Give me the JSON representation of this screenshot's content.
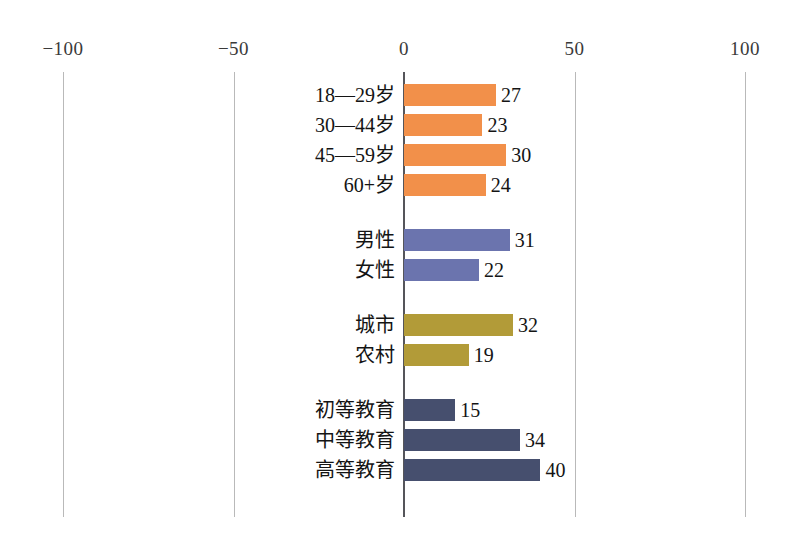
{
  "chart_data": {
    "type": "bar",
    "orientation": "horizontal",
    "title": "",
    "xlabel": "",
    "ylabel": "",
    "xlim": [
      -100,
      100
    ],
    "xticks": [
      -100,
      -50,
      0,
      50,
      100
    ],
    "xtick_labels": [
      "−100",
      "−50",
      "0",
      "50",
      "100"
    ],
    "grid": true,
    "legend": "none",
    "groups": [
      {
        "name": "age",
        "color": "#F2904A",
        "categories": [
          "18—29岁",
          "30—44岁",
          "45—59岁",
          "60+岁"
        ],
        "values": [
          27,
          23,
          30,
          24
        ]
      },
      {
        "name": "gender",
        "color": "#6B74AE",
        "categories": [
          "男性",
          "女性"
        ],
        "values": [
          31,
          22
        ]
      },
      {
        "name": "settlement",
        "color": "#B29B38",
        "categories": [
          "城市",
          "农村"
        ],
        "values": [
          32,
          19
        ]
      },
      {
        "name": "education",
        "color": "#464F6E",
        "categories": [
          "初等教育",
          "中等教育",
          "高等教育"
        ],
        "values": [
          15,
          34,
          40
        ]
      }
    ],
    "categories": [
      "18—29岁",
      "30—44岁",
      "45—59岁",
      "60+岁",
      "男性",
      "女性",
      "城市",
      "农村",
      "初等教育",
      "中等教育",
      "高等教育"
    ],
    "values": [
      27,
      23,
      30,
      24,
      31,
      22,
      32,
      19,
      15,
      34,
      40
    ]
  },
  "axis": {
    "ticks": [
      {
        "label": "−100",
        "value": -100
      },
      {
        "label": "−50",
        "value": -50
      },
      {
        "label": "0",
        "value": 0
      },
      {
        "label": "50",
        "value": 50
      },
      {
        "label": "100",
        "value": 100
      }
    ]
  },
  "rows": [
    {
      "label": "18—29岁",
      "value": 27,
      "value_text": "27",
      "color": "#F2904A",
      "group": "age"
    },
    {
      "label": "30—44岁",
      "value": 23,
      "value_text": "23",
      "color": "#F2904A",
      "group": "age"
    },
    {
      "label": "45—59岁",
      "value": 30,
      "value_text": "30",
      "color": "#F2904A",
      "group": "age"
    },
    {
      "label": "60+岁",
      "value": 24,
      "value_text": "24",
      "color": "#F2904A",
      "group": "age"
    },
    {
      "label": "男性",
      "value": 31,
      "value_text": "31",
      "color": "#6B74AE",
      "group": "gender"
    },
    {
      "label": "女性",
      "value": 22,
      "value_text": "22",
      "color": "#6B74AE",
      "group": "gender"
    },
    {
      "label": "城市",
      "value": 32,
      "value_text": "32",
      "color": "#B29B38",
      "group": "settlement"
    },
    {
      "label": "农村",
      "value": 19,
      "value_text": "19",
      "color": "#B29B38",
      "group": "settlement"
    },
    {
      "label": "初等教育",
      "value": 15,
      "value_text": "15",
      "color": "#464F6E",
      "group": "education"
    },
    {
      "label": "中等教育",
      "value": 34,
      "value_text": "34",
      "color": "#464F6E",
      "group": "education"
    },
    {
      "label": "高等教育",
      "value": 40,
      "value_text": "40",
      "color": "#464F6E",
      "group": "education"
    }
  ],
  "caption": {
    "text": ""
  },
  "colors": {
    "age": "#F2904A",
    "gender": "#6B74AE",
    "settlement": "#B29B38",
    "education": "#464F6E",
    "gridline": "#b9b9b9",
    "zero_axis": "#55555a",
    "background": "#ffffff"
  }
}
